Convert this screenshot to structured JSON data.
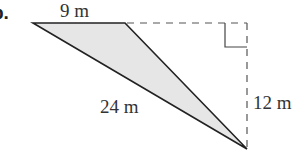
{
  "problem": {
    "part_label": "b.",
    "top_side_label": "9 m",
    "height_label": "12 m",
    "hypotenuse_label": "24 m"
  },
  "colors": {
    "fill": "#e6e6e6",
    "stroke": "#222222",
    "dashed": "#555555"
  }
}
